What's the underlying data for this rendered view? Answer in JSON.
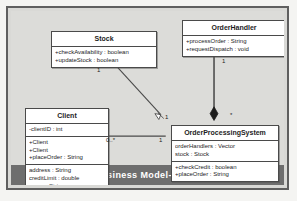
{
  "diagram": {
    "caption": "Business Model- Class",
    "classes": [
      {
        "id": "stock",
        "name": "Stock",
        "compartments": [
          {
            "members": [
              "+checkAvailability : boolean",
              "+updateStock : boolean"
            ]
          }
        ]
      },
      {
        "id": "orderhandler",
        "name": "OrderHandler",
        "compartments": [
          {
            "members": [
              "+processOrder : String",
              "+requestDispatch : void"
            ]
          }
        ]
      },
      {
        "id": "client",
        "name": "Client",
        "compartments": [
          {
            "members": [
              "-clientID : int"
            ]
          },
          {
            "members": [
              "+Client",
              "+Client",
              "+placeOrder : String"
            ]
          },
          {
            "members": [
              "address : String",
              "creditLimit : double",
              "name : String"
            ]
          }
        ]
      },
      {
        "id": "ops",
        "name": "OrderProcessingSystem",
        "compartments": [
          {
            "members": [
              "orderHandlers : Vector",
              "stock : Stock"
            ]
          },
          {
            "members": [
              "+checkCredit : boolean",
              "+placeOrder : String"
            ]
          }
        ]
      }
    ],
    "relationships": [
      {
        "id": "stock-ops",
        "kind": "navigable-association",
        "from": "Stock",
        "to": "OrderProcessingSystem",
        "source_multiplicity": "1",
        "target_multiplicity": "1"
      },
      {
        "id": "orderhandler-ops",
        "kind": "composition",
        "from": "OrderHandler",
        "to": "OrderProcessingSystem",
        "source_multiplicity": "1",
        "target_multiplicity": "*"
      },
      {
        "id": "client-ops",
        "kind": "association",
        "from": "Client",
        "to": "OrderProcessingSystem",
        "source_multiplicity": "0..*",
        "target_multiplicity": "1"
      }
    ],
    "colors": {
      "line": "#4a4a4a",
      "class_fill": "#ffffff",
      "canvas": "#dcdcd9",
      "caption_bar": "#6e6e6e",
      "caption_text": "#ffffff"
    }
  }
}
